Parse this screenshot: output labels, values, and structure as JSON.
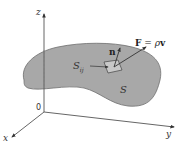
{
  "figure": {
    "axes": {
      "z_label": "z",
      "y_label": "y",
      "x_label": "x",
      "origin_label": "0"
    },
    "surface": {
      "label": "S",
      "fill": "#a8a8a8",
      "stroke": "#6e6e6e"
    },
    "patch": {
      "label_main": "S",
      "label_sub": "ij"
    },
    "vectors": {
      "normal_label": "n",
      "field_label_F": "F",
      "field_label_eq": " = ",
      "field_label_rho": "ρ",
      "field_label_v": "v"
    },
    "colors": {
      "axis": "#555555",
      "arrow": "#333333",
      "background": "#ffffff"
    }
  }
}
